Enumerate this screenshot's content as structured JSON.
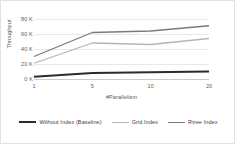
{
  "chart_data": {
    "type": "line",
    "title": "",
    "xlabel": "#Parallelism",
    "ylabel": "Throughput",
    "categories": [
      "1",
      "5",
      "10",
      "20"
    ],
    "x_tick_labels": [
      "1",
      "5",
      "10",
      "20"
    ],
    "y_tick_labels": [
      "0 K",
      "20 K",
      "40 K",
      "60 K",
      "80 K"
    ],
    "y_tick_values": [
      0,
      20000,
      40000,
      60000,
      80000
    ],
    "ylim": [
      0,
      80000
    ],
    "grid": true,
    "legend_position": "bottom",
    "series": [
      {
        "name": "Without Index (Baseline)",
        "values": [
          3000,
          8000,
          9000,
          10000
        ],
        "color": "#2b2b2b",
        "width": 2.2
      },
      {
        "name": "Grid Index",
        "values": [
          21000,
          48000,
          46000,
          54000
        ],
        "color": "#b5b5b5",
        "width": 1.3
      },
      {
        "name": "Rtree Index",
        "values": [
          30000,
          62000,
          64000,
          71000
        ],
        "color": "#7a7a7a",
        "width": 1.3
      }
    ]
  },
  "axis": {
    "y_title": "Throughput",
    "x_title": "#Parallelism"
  },
  "legend": {
    "items": [
      {
        "label": "Without Index (Baseline)"
      },
      {
        "label": "Grid Index"
      },
      {
        "label": "Rtree Index"
      }
    ]
  },
  "colors": {
    "baseline": "#2b2b2b",
    "grid_index": "#b5b5b5",
    "rtree_index": "#7a7a7a",
    "gridline": "#e8e8e8",
    "axis": "#c9c9c9",
    "text": "#5a5a5a",
    "border": "#e2e2e2",
    "background": "#ffffff"
  }
}
